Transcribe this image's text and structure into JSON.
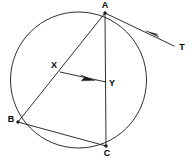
{
  "figure": {
    "background_color": "#ffffff",
    "stroke_color": "#1a1a1a",
    "label_color": "#000000",
    "width": 195,
    "height": 162
  },
  "circle": {
    "name": "main-circle",
    "cx": 78.5,
    "cy": 80,
    "r": 68
  },
  "points": [
    {
      "id": "A",
      "label": "A",
      "x": 105,
      "y": 13,
      "label_x": 105,
      "label_y": 8,
      "anchor": "middle",
      "dot": true
    },
    {
      "id": "B",
      "label": "B",
      "x": 18,
      "y": 122,
      "label_x": 11,
      "label_y": 122,
      "anchor": "middle",
      "dot": true
    },
    {
      "id": "C",
      "label": "C",
      "x": 106,
      "y": 146,
      "label_x": 107,
      "label_y": 156,
      "anchor": "middle",
      "dot": true
    },
    {
      "id": "X",
      "label": "X",
      "x": 60,
      "y": 72,
      "label_x": 54,
      "label_y": 68,
      "anchor": "middle",
      "dot": false
    },
    {
      "id": "Y",
      "label": "Y",
      "x": 106,
      "y": 82,
      "label_x": 112,
      "label_y": 86,
      "anchor": "middle",
      "dot": false
    },
    {
      "id": "T",
      "label": "T",
      "x": 174,
      "y": 46,
      "label_x": 182,
      "label_y": 50,
      "anchor": "middle",
      "dot": false
    }
  ],
  "segments": [
    {
      "name": "chord-AB",
      "from": "A",
      "to": "B",
      "x1": 105,
      "y1": 13,
      "x2": 18,
      "y2": 122
    },
    {
      "name": "chord-AC",
      "from": "A",
      "to": "C",
      "x1": 105,
      "y1": 13,
      "x2": 106,
      "y2": 146
    },
    {
      "name": "chord-BC",
      "from": "B",
      "to": "C",
      "x1": 18,
      "y1": 122,
      "x2": 106,
      "y2": 146
    },
    {
      "name": "segment-XY",
      "from": "X",
      "to": "Y",
      "x1": 60,
      "y1": 72,
      "x2": 106,
      "y2": 82
    },
    {
      "name": "tangent-AT",
      "from": "A",
      "to": "T",
      "x1": 105,
      "y1": 13,
      "x2": 174,
      "y2": 46
    }
  ],
  "arrows": [
    {
      "name": "tangent-arrowhead",
      "on_segment": "tangent-AT",
      "direction": "toward-A",
      "tip_x": 146,
      "tip_y": 31,
      "points": "146,31 158,38 155,33 158,35"
    },
    {
      "name": "xy-arrowhead",
      "on_segment": "segment-XY",
      "direction": "toward-Y",
      "tip_x": 94,
      "tip_y": 80,
      "points": "94,80 81,75 84,78 81,81"
    }
  ]
}
